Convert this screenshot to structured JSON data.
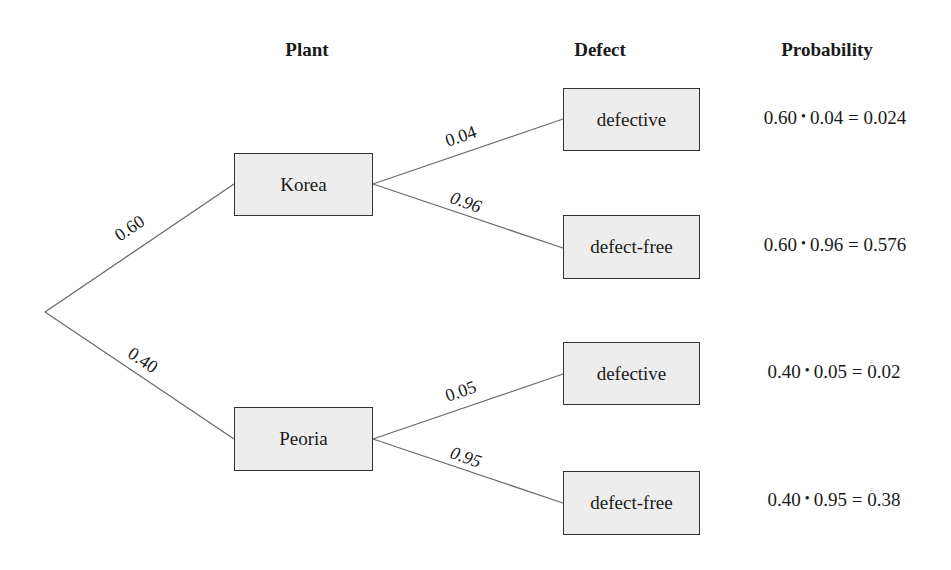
{
  "headers": {
    "plant": "Plant",
    "defect": "Defect",
    "probability": "Probability"
  },
  "nodes": {
    "korea": "Korea",
    "peoria": "Peoria",
    "korea_defective": "defective",
    "korea_defect_free": "defect-free",
    "peoria_defective": "defective",
    "peoria_defect_free": "defect-free"
  },
  "edges": {
    "root_korea": "0.60",
    "root_peoria": "0.40",
    "korea_defective": "0.04",
    "korea_defect_free": "0.96",
    "peoria_defective": "0.05",
    "peoria_defect_free": "0.95"
  },
  "probabilities": [
    {
      "a": "0.60",
      "b": "0.04",
      "result": "0.024"
    },
    {
      "a": "0.60",
      "b": "0.96",
      "result": "0.576"
    },
    {
      "a": "0.40",
      "b": "0.05",
      "result": "0.02"
    },
    {
      "a": "0.40",
      "b": "0.95",
      "result": "0.38"
    }
  ],
  "symbols": {
    "dot": "•",
    "equals": "="
  },
  "colors": {
    "line": "#6b6b6b",
    "node_fill": "#ededed",
    "node_border": "#333333"
  }
}
